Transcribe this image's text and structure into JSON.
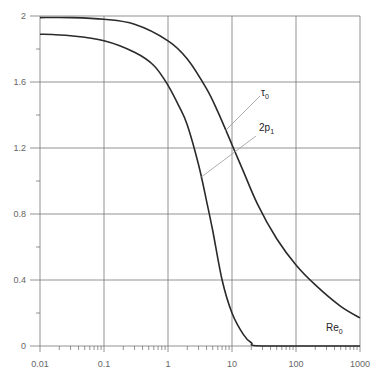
{
  "chart_data": {
    "type": "line",
    "title": "",
    "xlabel": "",
    "ylabel": "",
    "xscale": "log",
    "xlim": [
      0.01,
      1000
    ],
    "ylim": [
      0,
      2
    ],
    "grid": true,
    "legend": "inline curve labels",
    "x_ticks": [
      "0.01",
      "0.1",
      "1",
      "10",
      "100",
      "1000"
    ],
    "y_ticks": [
      "0",
      "0.4",
      "0.8",
      "1.2",
      "1.6",
      "2"
    ],
    "annotations": [
      {
        "text": "τ₀",
        "for_series": "tau0"
      },
      {
        "text": "2p₁",
        "for_series": "2p1"
      },
      {
        "text": "Re₀",
        "role": "x-variable label"
      }
    ],
    "series": [
      {
        "name": "τ₀",
        "id": "tau0",
        "x": [
          0.01,
          0.03,
          0.1,
          0.3,
          1,
          2,
          4,
          6,
          10,
          15,
          25,
          50,
          100,
          200,
          500,
          1000
        ],
        "y": [
          1.99,
          1.99,
          1.98,
          1.95,
          1.85,
          1.74,
          1.56,
          1.42,
          1.22,
          1.06,
          0.86,
          0.65,
          0.49,
          0.37,
          0.24,
          0.17
        ]
      },
      {
        "name": "2p₁",
        "id": "2p1",
        "x": [
          0.01,
          0.03,
          0.1,
          0.3,
          0.6,
          1,
          1.5,
          2,
          3,
          4,
          5,
          7,
          10,
          15,
          20,
          30,
          1000
        ],
        "y": [
          1.89,
          1.88,
          1.85,
          1.78,
          1.7,
          1.58,
          1.45,
          1.34,
          1.1,
          0.88,
          0.7,
          0.4,
          0.2,
          0.07,
          0.02,
          0.0,
          0.0
        ]
      }
    ]
  },
  "labels": {
    "tau0_base": "τ",
    "tau0_sub": "0",
    "p1_base": "2p",
    "p1_sub": "1",
    "re_base": "Re",
    "re_sub": "0"
  },
  "colors": {
    "curve": "#2a2a2a",
    "grid": "#777777",
    "leader": "#9a9a9a",
    "tick_text": "#666666"
  }
}
